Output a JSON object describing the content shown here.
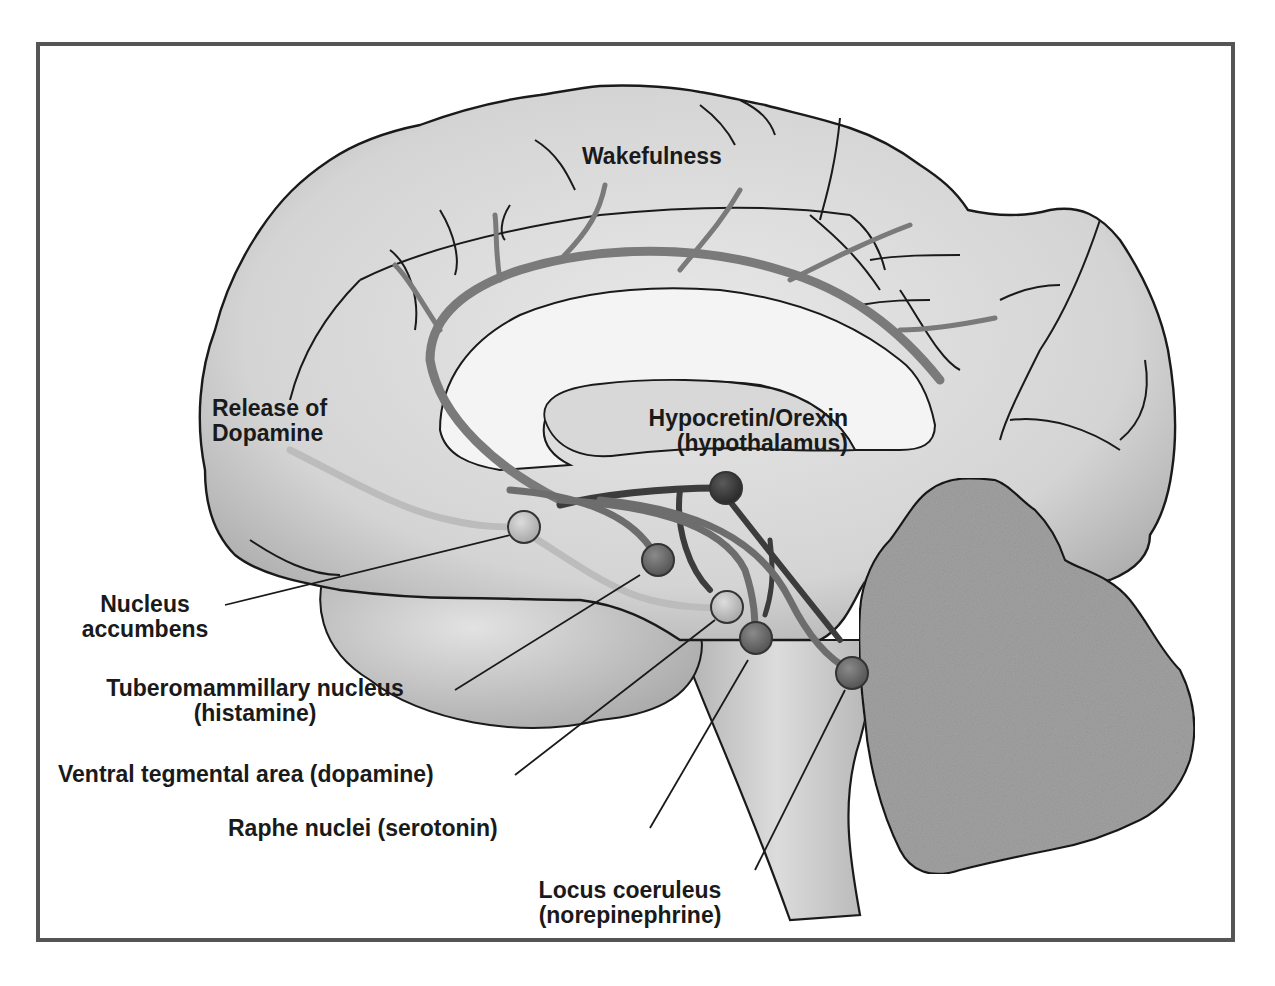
{
  "diagram": {
    "title_region": "Wakefulness",
    "colors": {
      "frame_border": "#555555",
      "brain_fill": "#d6d6d6",
      "brain_outline": "#1a1a1a",
      "cerebellum_fill": "#a6a6a6",
      "orexin_node": "#3a3a3a",
      "histamine_node": "#6e6e6e",
      "dopamine_node": "#bdbdbd",
      "serotonin_node": "#6a6a6a",
      "norepinephrine_node": "#5f5f5f",
      "pathway_medium": "#7a7a7a",
      "pathway_dark": "#3c3c3c",
      "pathway_light": "#bababa"
    },
    "labels": {
      "wakefulness": "Wakefulness",
      "release_line1": "Release of",
      "release_line2": "Dopamine",
      "orexin_line1": "Hypocretin/Orexin",
      "orexin_line2": "(hypothalamus)",
      "accumbens_line1": "Nucleus",
      "accumbens_line2": "accumbens",
      "tmn_line1": "Tuberomammillary nucleus",
      "tmn_line2": "(histamine)",
      "vta": "Ventral tegmental area (dopamine)",
      "raphe": "Raphe nuclei (serotonin)",
      "lc_line1": "Locus coeruleus",
      "lc_line2": "(norepinephrine)"
    },
    "nuclei": [
      {
        "name": "Hypocretin/Orexin (hypothalamus)",
        "shade": "dark"
      },
      {
        "name": "Nucleus accumbens",
        "shade": "light"
      },
      {
        "name": "Tuberomammillary nucleus (histamine)",
        "shade": "medium"
      },
      {
        "name": "Ventral tegmental area (dopamine)",
        "shade": "light"
      },
      {
        "name": "Raphe nuclei (serotonin)",
        "shade": "medium"
      },
      {
        "name": "Locus coeruleus (norepinephrine)",
        "shade": "medium"
      }
    ]
  }
}
